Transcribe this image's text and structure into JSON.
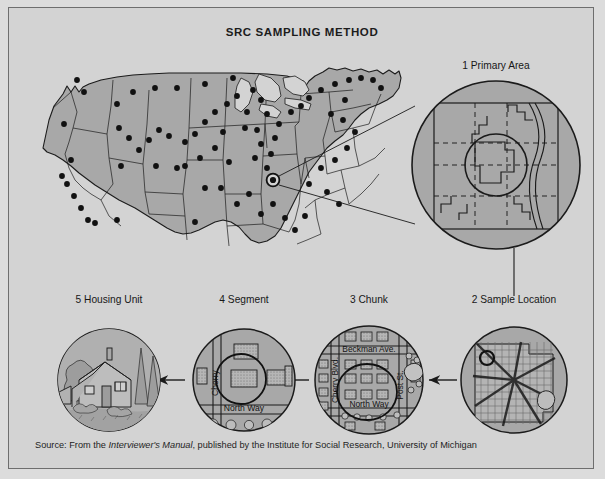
{
  "figure": {
    "title": "SRC SAMPLING METHOD",
    "background_color": "#d3d3d3",
    "border_color": "#6e6e6e",
    "land_color": "#a8a8a8",
    "ink_color": "#1b1b1b"
  },
  "source": {
    "prefix": "Source: From the ",
    "italic_title": "Interviewer's Manual",
    "suffix": ", published by the Institute for Social Research, University of Michigan"
  },
  "stages": [
    {
      "number": "1",
      "name": "Primary Area",
      "label": "1  Primary  Area",
      "description": "County map inside magnifier circle with dashed township grid, inner sample-location circle and a river along the east edge."
    },
    {
      "number": "2",
      "name": "Sample Location",
      "label": "2  Sample Location",
      "description": "City street grid with radiating diagonal avenues and a small circled chunk marker at the upper left."
    },
    {
      "number": "3",
      "name": "Chunk",
      "label": "3  Chunk",
      "description": "Block of city streets with building footprints; the selected segment is ringed.",
      "streets": [
        "Beckman Ave.",
        "Cherry Blvd.",
        "Post St.",
        "North Way"
      ]
    },
    {
      "number": "4",
      "name": "Segment",
      "label": "4  Segment",
      "description": "A few buildings along one street; the selected housing unit is ringed.",
      "streets": [
        "Cherry",
        "North Way"
      ]
    },
    {
      "number": "5",
      "name": "Housing Unit",
      "label": "5  Housing Unit",
      "description": "Line drawing of a single house with trees and shrubs."
    }
  ],
  "us_map": {
    "description": "Outline map of the contiguous United States with state boundaries; black dots mark the selected primary sampling areas.",
    "selected_marker": "circled dot in the Tennessee / Kentucky area",
    "dot_count": 74
  },
  "connectors": {
    "magnifier_lines": "two lines from the circled dot on the US map to the Primary Area circle",
    "drop_line": "vertical line from the Primary Area circle down to the Sample Location label",
    "arrow_direction": "right-to-left arrows linking stage 2 to 3 to 4 to 5"
  }
}
